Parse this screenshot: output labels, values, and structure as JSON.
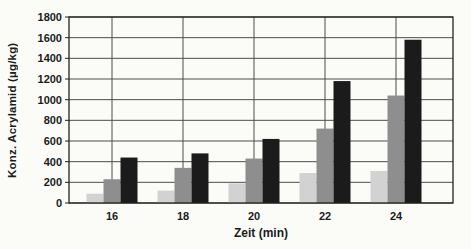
{
  "page": {
    "background_color": "#fbfbf8"
  },
  "chart_data": {
    "type": "bar",
    "title": "",
    "categories": [
      "16",
      "18",
      "20",
      "22",
      "24"
    ],
    "series": [
      {
        "name": "light-gray-bars",
        "color": "#d2d2d2",
        "values": [
          90,
          120,
          190,
          290,
          310
        ]
      },
      {
        "name": "medium-gray-bars",
        "color": "#8e8e8e",
        "values": [
          230,
          340,
          430,
          720,
          1040
        ]
      },
      {
        "name": "black-bars",
        "color": "#1b1b1b",
        "values": [
          440,
          480,
          620,
          1180,
          1580
        ]
      }
    ],
    "xlabel": "Zeit (min)",
    "ylabel": "Konz. Acrylamid (µg/kg)",
    "ylim": [
      0,
      1800
    ],
    "yticks": [
      0,
      200,
      400,
      600,
      800,
      1000,
      1200,
      1400,
      1600,
      1800
    ],
    "grid": {
      "horizontal": true,
      "vertical_at_category_centers": true
    },
    "legend_position": "none",
    "frame_color": "#222222",
    "gridline_color": "#4d4d4d"
  }
}
